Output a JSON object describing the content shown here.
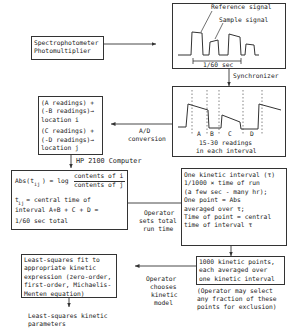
{
  "nodes": {
    "spectrophotometer": {
      "lines": [
        "Spectrophotometer",
        "Photomultiplier"
      ]
    },
    "signal_box": {
      "reference_label": "Reference signal",
      "sample_label": "Sample signal",
      "period_label": "1/60 sec"
    },
    "synchronizer_label": "Synchronizer",
    "intervals_box": {
      "interval_labels": [
        "A",
        "B",
        "C",
        "D"
      ],
      "caption_lines": [
        "15-30 readings",
        "in each interval"
      ]
    },
    "ad_conversion_label": [
      "A/D",
      "conversion"
    ],
    "locations_box": {
      "lines": [
        "(A readings) +",
        "(-B readings)→",
        "location i",
        "(C readings) +",
        "(-D readings)→",
        "location j"
      ]
    },
    "computer_label": "HP 2100 Computer",
    "computer_box": {
      "abs_prefix": "Abs(t",
      "abs_sub": "ij",
      "abs_mid": ") = log",
      "numerator": "contents of i",
      "denominator": "contents of j",
      "time_lines": [
        "t  = central time of",
        "interval A+B + C + D =",
        "1/60 sec total"
      ],
      "time_sub": "ij"
    },
    "operator_total_label": [
      "Operator",
      "sets total",
      "run time"
    ],
    "kinetic_interval_box": {
      "lines": [
        "One kinetic interval (τ)",
        "1/1000 × time of run",
        "(a few sec - many hr);",
        "One point = Abs",
        "averaged over τ;",
        "Time of point = central",
        "time of interval τ"
      ]
    },
    "kinetic_points_box": {
      "lines": [
        "1000 kinetic points,",
        "each averaged over",
        "one kinetic interval"
      ]
    },
    "exclusion_note": [
      "(Operator may select",
      "any fraction of these",
      "points for exclusion)"
    ],
    "operator_model_label": [
      "Operator",
      "chooses",
      "kinetic",
      "model"
    ],
    "least_squares_box": {
      "lines": [
        "Least-squares fit to",
        "appropriate kinetic",
        "expression (zero-order,",
        "first-order, Michaelis-",
        "Menten equation)"
      ]
    },
    "output_label": [
      "Least-squares kinetic",
      "parameters"
    ]
  }
}
